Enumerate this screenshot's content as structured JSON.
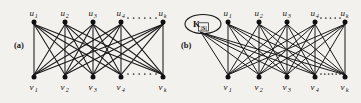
{
  "figure": {
    "background_color": "#f3f1ee",
    "ink_color": "#191919",
    "width": 361,
    "height": 103
  },
  "panels": [
    {
      "id": "a",
      "label": "(a)",
      "label_pos": {
        "x": 14,
        "y": 48
      },
      "type": "complete-bipartite-graph",
      "graph_name": "K_{k,k}",
      "top_nodes": [
        {
          "id": "u1",
          "base": "u",
          "sub": "1",
          "x": 34,
          "y": 22
        },
        {
          "id": "u2",
          "base": "u",
          "sub": "2",
          "x": 65,
          "y": 22
        },
        {
          "id": "u3",
          "base": "u",
          "sub": "3",
          "x": 93,
          "y": 22
        },
        {
          "id": "u4",
          "base": "u",
          "sub": "4",
          "x": 121,
          "y": 22
        },
        {
          "id": "uk",
          "base": "u",
          "sub": "k",
          "x": 163,
          "y": 22
        }
      ],
      "bottom_nodes": [
        {
          "id": "v1",
          "base": "v",
          "sub": "1",
          "x": 34,
          "y": 77
        },
        {
          "id": "v2",
          "base": "v",
          "sub": "2",
          "x": 65,
          "y": 77
        },
        {
          "id": "v3",
          "base": "v",
          "sub": "3",
          "x": 93,
          "y": 77
        },
        {
          "id": "v4",
          "base": "v",
          "sub": "4",
          "x": 121,
          "y": 77
        },
        {
          "id": "vk",
          "base": "v",
          "sub": "k",
          "x": 163,
          "y": 77
        }
      ],
      "top_ellipsis": {
        "x1": 128,
        "x2": 156,
        "y": 18,
        "dots": 6
      },
      "bottom_ellipsis": {
        "x1": 128,
        "x2": 156,
        "y": 74,
        "dots": 6
      },
      "extra_node": null
    },
    {
      "id": "b",
      "label": "(b)",
      "label_pos": {
        "x": 181,
        "y": 48
      },
      "type": "complete-bipartite-graph-with-clique",
      "graph_name": "K_{k,k} + K_|S|",
      "top_nodes": [
        {
          "id": "u1",
          "base": "u",
          "sub": "1",
          "x": 228,
          "y": 22
        },
        {
          "id": "u2",
          "base": "u",
          "sub": "2",
          "x": 259,
          "y": 22
        },
        {
          "id": "u3",
          "base": "u",
          "sub": "3",
          "x": 287,
          "y": 22
        },
        {
          "id": "u4",
          "base": "u",
          "sub": "4",
          "x": 315,
          "y": 22
        },
        {
          "id": "uk",
          "base": "u",
          "sub": "k",
          "x": 345,
          "y": 22
        }
      ],
      "bottom_nodes": [
        {
          "id": "v1",
          "base": "v",
          "sub": "1",
          "x": 228,
          "y": 77
        },
        {
          "id": "v2",
          "base": "v",
          "sub": "2",
          "x": 259,
          "y": 77
        },
        {
          "id": "v3",
          "base": "v",
          "sub": "3",
          "x": 287,
          "y": 77
        },
        {
          "id": "v4",
          "base": "v",
          "sub": "4",
          "x": 315,
          "y": 77
        },
        {
          "id": "vk",
          "base": "v",
          "sub": "k",
          "x": 345,
          "y": 77
        }
      ],
      "top_ellipsis": {
        "x1": 321,
        "x2": 340,
        "y": 18,
        "dots": 5
      },
      "bottom_ellipsis": {
        "x1": 321,
        "x2": 340,
        "y": 74,
        "dots": 6
      },
      "extra_node": {
        "id": "K_S",
        "label_base": "K",
        "label_sub": "|S|",
        "cx": 203,
        "cy": 24,
        "rx": 18,
        "ry": 9.5,
        "shape": "ellipse"
      }
    }
  ]
}
